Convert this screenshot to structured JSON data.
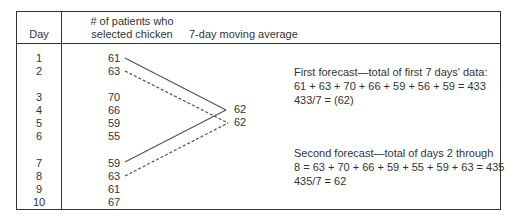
{
  "table": {
    "headers": {
      "day": "Day",
      "patients_line1": "# of patients who",
      "patients_line2": "selected chicken",
      "moving_avg": "7-day moving average"
    },
    "rows": [
      {
        "day": "1",
        "value": "61"
      },
      {
        "day": "2",
        "value": "63"
      },
      {
        "day": "3",
        "value": "70"
      },
      {
        "day": "4",
        "value": "66"
      },
      {
        "day": "5",
        "value": "59"
      },
      {
        "day": "6",
        "value": "55"
      },
      {
        "day": "7",
        "value": "59"
      },
      {
        "day": "8",
        "value": "63"
      },
      {
        "day": "9",
        "value": "61"
      },
      {
        "day": "10",
        "value": "67"
      }
    ],
    "averages": [
      "62",
      "62"
    ]
  },
  "notes": {
    "first": {
      "line1": "First forecast—total of first 7 days' data:",
      "line2": "61 + 63 + 70 + 66 + 59 + 56 + 59 = 433",
      "line3": "433/7 = (62)"
    },
    "second": {
      "line1": "Second forecast—total of days 2 through",
      "line2": "8 = 63 + 70 + 66 + 59 + 55 + 59 + 63 = 435",
      "line3": "435/7 = 62"
    }
  }
}
